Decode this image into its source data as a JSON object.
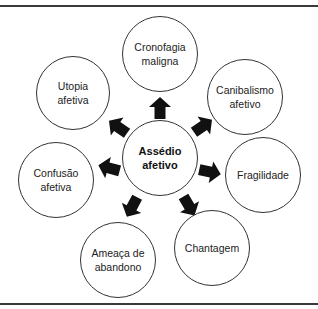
{
  "diagram": {
    "center": {
      "label": "Assédio\nafetivo",
      "cx": 160,
      "cy": 158,
      "r": 38
    },
    "nodes": [
      {
        "id": "cronofagia",
        "label": "Cronofagia\nmaligna",
        "cx": 160,
        "cy": 54,
        "r": 38
      },
      {
        "id": "canibalismo",
        "label": "Canibalismo\nafetivo",
        "cx": 245,
        "cy": 97,
        "r": 38
      },
      {
        "id": "fragilidade",
        "label": "Fragilidade",
        "cx": 263,
        "cy": 175,
        "r": 38
      },
      {
        "id": "chantagem",
        "label": "Chantagem",
        "cx": 212,
        "cy": 248,
        "r": 38
      },
      {
        "id": "ameaca",
        "label": "Ameaça de\nabandono",
        "cx": 118,
        "cy": 260,
        "r": 38
      },
      {
        "id": "confusao",
        "label": "Confusão\nafetiva",
        "cx": 56,
        "cy": 180,
        "r": 38
      },
      {
        "id": "utopia",
        "label": "Utopia\nafetiva",
        "cx": 73,
        "cy": 93,
        "r": 37
      }
    ],
    "arrows": [
      {
        "target": "cronofagia",
        "cx": 160,
        "cy": 108,
        "angle": -90
      },
      {
        "target": "canibalismo",
        "cx": 203,
        "cy": 126,
        "angle": -35
      },
      {
        "target": "fragilidade",
        "cx": 210,
        "cy": 172,
        "angle": 12
      },
      {
        "target": "chantagem",
        "cx": 189,
        "cy": 206,
        "angle": 60
      },
      {
        "target": "ameaca",
        "cx": 132,
        "cy": 207,
        "angle": 118
      },
      {
        "target": "confusao",
        "cx": 109,
        "cy": 168,
        "angle": 195
      },
      {
        "target": "utopia",
        "cx": 118,
        "cy": 127,
        "angle": 215
      }
    ],
    "colors": {
      "arrow": "#111111",
      "stroke": "#333333",
      "rule": "#3a3a3a"
    }
  }
}
